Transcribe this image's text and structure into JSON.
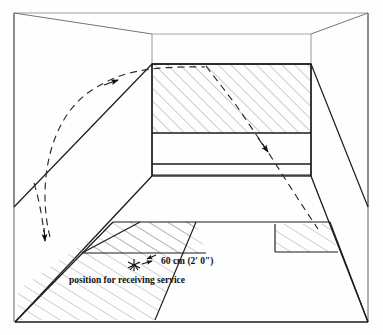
{
  "diagram": {
    "labels": {
      "dimension": "60 cm (2′ 0″)",
      "position": "position for receiving service"
    },
    "colors": {
      "line": "#1a1a1a",
      "hatch": "#8a8a8a",
      "faint": "#9a9a9a",
      "background": "#ffffff"
    },
    "geometry": {
      "outer_frame": {
        "top_left": [
          14,
          13
        ],
        "top_right": [
          368,
          13
        ],
        "bottom_left": [
          15,
          322
        ],
        "bottom_right": [
          368,
          322
        ]
      },
      "front_wall": {
        "top_left": [
          152,
          64
        ],
        "top_right": [
          311,
          64
        ],
        "bottom_left": [
          152,
          176
        ],
        "bottom_right": [
          311,
          176
        ],
        "out_line_y": 133,
        "service_line_y": 164,
        "tin_top_y": 175
      },
      "ceiling_front_left": [
        152,
        34
      ],
      "ceiling_front_right": [
        311,
        34
      ]
    },
    "elements": {
      "out_of_court_hatch": "hatched area above the out line on the front wall",
      "tin_band": "board / tin at base of front wall",
      "service_boxes": "hatched quarter-court service boxes on the floor",
      "trajectory_incoming": "dashed ball path arriving at front wall",
      "trajectory_outgoing": "dashed ball path returning down the side wall",
      "player_marker": "receiver position cross marker",
      "dimension_arrow": "double-headed arrow showing 60 cm offset"
    }
  }
}
